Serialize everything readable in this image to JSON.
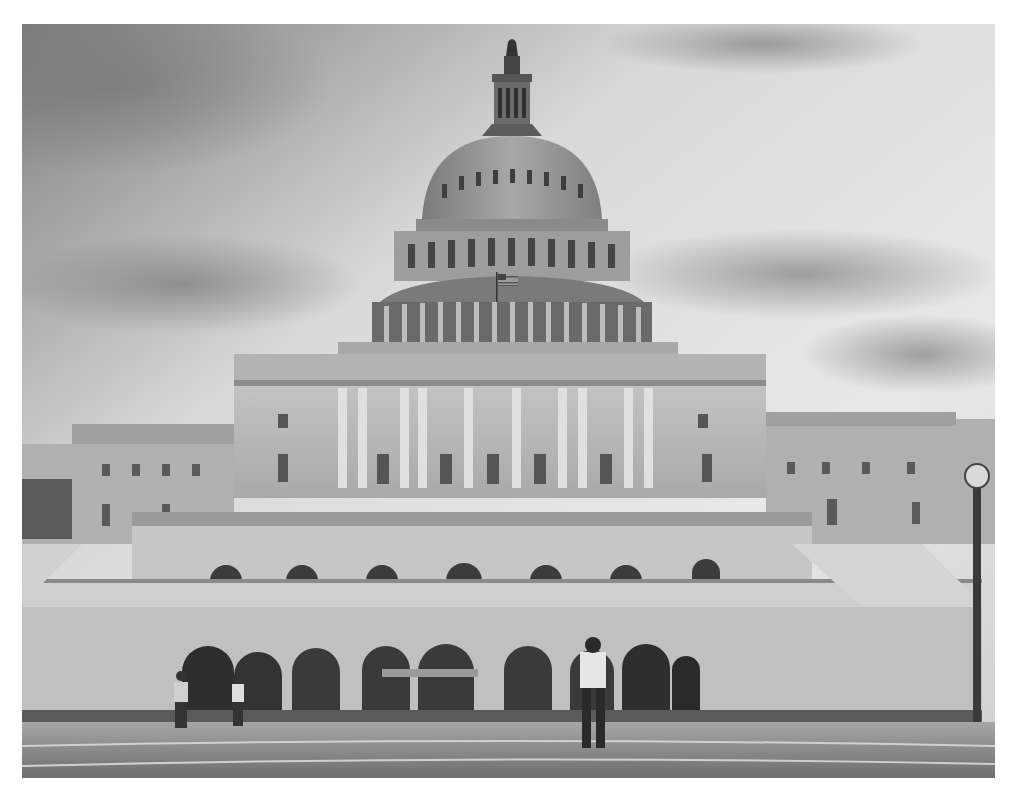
{
  "image": {
    "subject": "United States Capitol building",
    "style": "grayscale photograph",
    "alt": "Grayscale photo of the U.S. Capitol dome and west front under a cloudy sky, with people standing on the plaza in front",
    "colors": {
      "background": "#ffffff",
      "sky_light": "#e6e6e6",
      "sky_dark": "#8a8a8a",
      "building": "#b8b8b8",
      "building_shadow": "#6a6a6a",
      "plaza": "#9a9a9a"
    },
    "flag": "american-flag"
  }
}
